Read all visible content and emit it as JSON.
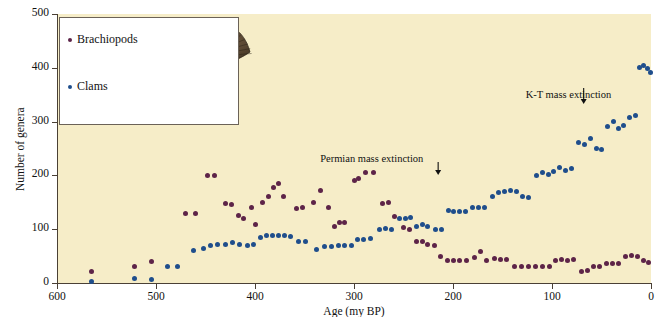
{
  "chart_data": {
    "type": "scatter",
    "title": "",
    "xlabel": "Age (my BP)",
    "ylabel": "Number of genera",
    "xlim": [
      600,
      0
    ],
    "ylim": [
      0,
      500
    ],
    "xticks": [
      600,
      500,
      400,
      300,
      200,
      100,
      0
    ],
    "yticks": [
      0,
      100,
      200,
      300,
      400,
      500
    ],
    "x_axis_reversed": true,
    "grid": false,
    "legend_position": "top-left-inset",
    "background_color": "#f6edc8",
    "annotations": [
      {
        "text": "Permian mass extinction",
        "x": 215,
        "y": 215,
        "arrow": "down"
      },
      {
        "text": "K-T mass extinction",
        "x": 68,
        "y": 330,
        "arrow": "down"
      }
    ],
    "series": [
      {
        "name": "Brachiopods",
        "color": "#5d2448",
        "marker": "circle",
        "points": [
          [
            565,
            22
          ],
          [
            522,
            30
          ],
          [
            505,
            40
          ],
          [
            470,
            130
          ],
          [
            460,
            130
          ],
          [
            448,
            200
          ],
          [
            441,
            200
          ],
          [
            430,
            148
          ],
          [
            424,
            145
          ],
          [
            417,
            125
          ],
          [
            412,
            120
          ],
          [
            404,
            140
          ],
          [
            399,
            108
          ],
          [
            392,
            150
          ],
          [
            386,
            160
          ],
          [
            381,
            178
          ],
          [
            376,
            185
          ],
          [
            371,
            160
          ],
          [
            358,
            138
          ],
          [
            352,
            140
          ],
          [
            341,
            150
          ],
          [
            334,
            172
          ],
          [
            326,
            140
          ],
          [
            320,
            105
          ],
          [
            315,
            113
          ],
          [
            310,
            112
          ],
          [
            300,
            190
          ],
          [
            295,
            195
          ],
          [
            288,
            205
          ],
          [
            280,
            205
          ],
          [
            271,
            148
          ],
          [
            265,
            150
          ],
          [
            259,
            123
          ],
          [
            250,
            104
          ],
          [
            244,
            100
          ],
          [
            237,
            78
          ],
          [
            231,
            78
          ],
          [
            226,
            72
          ],
          [
            219,
            70
          ],
          [
            213,
            50
          ],
          [
            206,
            42
          ],
          [
            199,
            42
          ],
          [
            193,
            42
          ],
          [
            186,
            42
          ],
          [
            178,
            48
          ],
          [
            172,
            58
          ],
          [
            166,
            42
          ],
          [
            158,
            46
          ],
          [
            152,
            44
          ],
          [
            146,
            44
          ],
          [
            138,
            30
          ],
          [
            131,
            31
          ],
          [
            124,
            30
          ],
          [
            117,
            30
          ],
          [
            110,
            31
          ],
          [
            103,
            31
          ],
          [
            96,
            42
          ],
          [
            90,
            44
          ],
          [
            84,
            42
          ],
          [
            78,
            44
          ],
          [
            70,
            22
          ],
          [
            64,
            24
          ],
          [
            58,
            30
          ],
          [
            52,
            30
          ],
          [
            45,
            36
          ],
          [
            39,
            36
          ],
          [
            33,
            36
          ],
          [
            26,
            50
          ],
          [
            20,
            52
          ],
          [
            14,
            50
          ],
          [
            8,
            42
          ],
          [
            3,
            38
          ]
        ]
      },
      {
        "name": "Clams",
        "color": "#1f4e8c",
        "marker": "circle",
        "points": [
          [
            565,
            2
          ],
          [
            522,
            8
          ],
          [
            505,
            6
          ],
          [
            488,
            30
          ],
          [
            478,
            30
          ],
          [
            462,
            60
          ],
          [
            452,
            65
          ],
          [
            445,
            70
          ],
          [
            438,
            72
          ],
          [
            430,
            72
          ],
          [
            423,
            75
          ],
          [
            416,
            72
          ],
          [
            408,
            70
          ],
          [
            402,
            72
          ],
          [
            394,
            85
          ],
          [
            388,
            88
          ],
          [
            382,
            88
          ],
          [
            376,
            88
          ],
          [
            370,
            88
          ],
          [
            364,
            86
          ],
          [
            356,
            78
          ],
          [
            349,
            78
          ],
          [
            338,
            62
          ],
          [
            330,
            68
          ],
          [
            323,
            68
          ],
          [
            316,
            70
          ],
          [
            310,
            70
          ],
          [
            303,
            70
          ],
          [
            296,
            80
          ],
          [
            290,
            80
          ],
          [
            283,
            82
          ],
          [
            274,
            100
          ],
          [
            268,
            102
          ],
          [
            262,
            100
          ],
          [
            254,
            120
          ],
          [
            248,
            120
          ],
          [
            243,
            122
          ],
          [
            237,
            105
          ],
          [
            231,
            108
          ],
          [
            226,
            105
          ],
          [
            218,
            100
          ],
          [
            212,
            100
          ],
          [
            205,
            135
          ],
          [
            199,
            132
          ],
          [
            193,
            132
          ],
          [
            187,
            132
          ],
          [
            180,
            140
          ],
          [
            174,
            140
          ],
          [
            168,
            140
          ],
          [
            160,
            160
          ],
          [
            154,
            168
          ],
          [
            148,
            170
          ],
          [
            142,
            172
          ],
          [
            136,
            170
          ],
          [
            130,
            160
          ],
          [
            124,
            158
          ],
          [
            116,
            200
          ],
          [
            110,
            205
          ],
          [
            104,
            202
          ],
          [
            98,
            208
          ],
          [
            92,
            215
          ],
          [
            86,
            210
          ],
          [
            80,
            212
          ],
          [
            73,
            262
          ],
          [
            67,
            258
          ],
          [
            61,
            268
          ],
          [
            55,
            250
          ],
          [
            50,
            248
          ],
          [
            44,
            290
          ],
          [
            38,
            300
          ],
          [
            33,
            288
          ],
          [
            28,
            292
          ],
          [
            22,
            308
          ],
          [
            16,
            312
          ],
          [
            12,
            400
          ],
          [
            8,
            405
          ],
          [
            4,
            398
          ],
          [
            1,
            392
          ]
        ]
      }
    ]
  },
  "legend": {
    "items": [
      {
        "label": "Brachiopods",
        "color": "#5d2448"
      },
      {
        "label": "Clams",
        "color": "#1f4e8c"
      }
    ],
    "fossil_images": [
      {
        "name": "brachiopod-fossil-photo",
        "alt": "Brachiopod fossil shell"
      },
      {
        "name": "clam-fossil-photo",
        "alt": "Clam fossil shell"
      }
    ]
  }
}
